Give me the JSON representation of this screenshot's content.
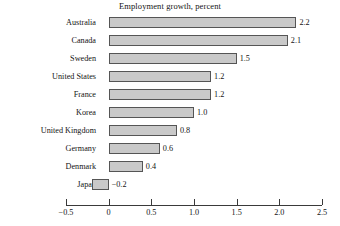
{
  "chart_data": {
    "type": "bar",
    "orientation": "horizontal",
    "title": "Employment growth, percent",
    "xlabel": "",
    "ylabel": "",
    "categories": [
      "Australia",
      "Canada",
      "Sweden",
      "United States",
      "France",
      "Korea",
      "United Kingdom",
      "Germany",
      "Denmark",
      "Japan"
    ],
    "values": [
      2.2,
      2.1,
      1.5,
      1.2,
      1.2,
      1.0,
      0.8,
      0.6,
      0.4,
      -0.2
    ],
    "value_labels": [
      "2.2",
      "2.1",
      "1.5",
      "1.2",
      "1.2",
      "1.0",
      "0.8",
      "0.6",
      "0.4",
      "−0.2"
    ],
    "xlim": [
      -0.5,
      2.5
    ],
    "xticks": [
      -0.5,
      0,
      0.5,
      1.0,
      1.5,
      2.0,
      2.5
    ],
    "xtick_labels": [
      "−0.5",
      "0",
      "0.5",
      "1.0",
      "1.5",
      "2.0",
      "2.5"
    ],
    "grid": false,
    "legend": false,
    "bar_fill_color": "#c9c9c9",
    "bar_border_color": "#555555",
    "axis_color": "#3a3a3a",
    "text_color": "#141414"
  }
}
